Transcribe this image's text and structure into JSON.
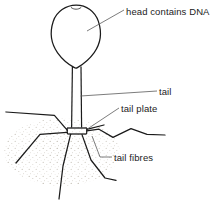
{
  "figure": {
    "name": "bacteriophage-diagram",
    "background_color": "#ffffff",
    "ink_color": "#1b1b1b",
    "stipple_color": "#b9b3a8"
  },
  "labels": {
    "head": "head contains DNA",
    "tail": "tail",
    "tail_plate": "tail plate",
    "tail_fibres": "tail fibres"
  },
  "parts": {
    "head": {
      "name": "head",
      "shape": "teardrop",
      "note": "head contains DNA"
    },
    "tail": {
      "name": "tail",
      "shape": "narrow-tube"
    },
    "tail_plate": {
      "name": "tail plate",
      "shape": "horizontal-bar"
    },
    "tail_fibres": {
      "name": "tail fibres",
      "count": 6
    },
    "stipple_field": {
      "name": "stipple-texture",
      "note": "dotted shading around lower body"
    }
  }
}
